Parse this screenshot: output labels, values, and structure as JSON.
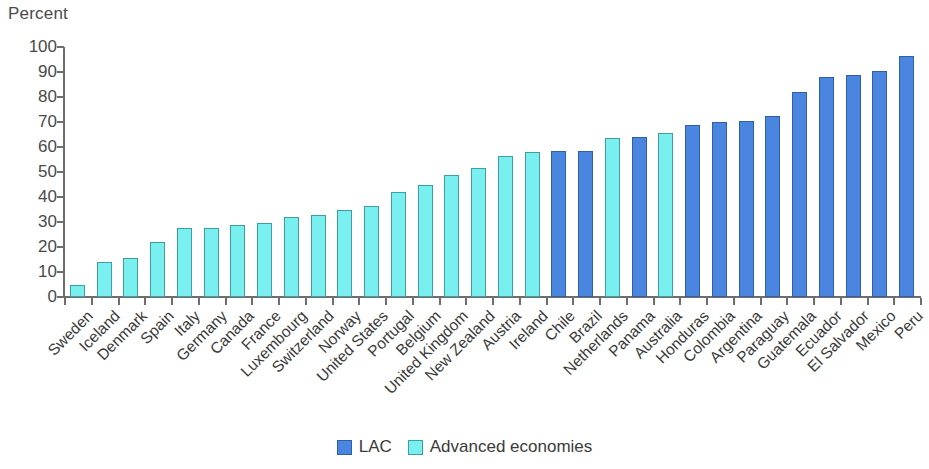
{
  "chart_data": {
    "type": "bar",
    "title": "",
    "subtitle": "",
    "xlabel": "",
    "ylabel": "Percent",
    "ylim": [
      0,
      100
    ],
    "ytick_step": 10,
    "yticks": [
      0,
      10,
      20,
      30,
      40,
      50,
      60,
      70,
      80,
      90,
      100
    ],
    "grid": false,
    "legend_position": "bottom-center",
    "categories": [
      "Sweden",
      "Iceland",
      "Denmark",
      "Spain",
      "Italy",
      "Germany",
      "Canada",
      "France",
      "Luxembourg",
      "Switzerland",
      "Norway",
      "United States",
      "Portugal",
      "Belgium",
      "United Kingdom",
      "New Zealand",
      "Austria",
      "Ireland",
      "Chile",
      "Brazil",
      "Netherlands",
      "Panama",
      "Australia",
      "Honduras",
      "Colombia",
      "Argentina",
      "Paraguay",
      "Guatemala",
      "Ecuador",
      "El Salvador",
      "Mexico",
      "Peru"
    ],
    "values": [
      5,
      14,
      15.5,
      22,
      27.5,
      27.5,
      29,
      29.5,
      32,
      33,
      35,
      36.5,
      42,
      45,
      49,
      51.5,
      56.5,
      58,
      58.5,
      58.5,
      63.5,
      64,
      65.5,
      69,
      70,
      70.5,
      72.5,
      82,
      88,
      89,
      90.5,
      96.5
    ],
    "groups": [
      "adv",
      "adv",
      "adv",
      "adv",
      "adv",
      "adv",
      "adv",
      "adv",
      "adv",
      "adv",
      "adv",
      "adv",
      "adv",
      "adv",
      "adv",
      "adv",
      "adv",
      "adv",
      "lac",
      "lac",
      "adv",
      "lac",
      "adv",
      "lac",
      "lac",
      "lac",
      "lac",
      "lac",
      "lac",
      "lac",
      "lac",
      "lac"
    ],
    "series": [
      {
        "name": "LAC",
        "key": "lac",
        "color": "#4a86e0",
        "points": [
          {
            "category": "Chile",
            "value": 58.5
          },
          {
            "category": "Brazil",
            "value": 58.5
          },
          {
            "category": "Panama",
            "value": 64
          },
          {
            "category": "Honduras",
            "value": 69
          },
          {
            "category": "Colombia",
            "value": 70
          },
          {
            "category": "Argentina",
            "value": 70.5
          },
          {
            "category": "Paraguay",
            "value": 72.5
          },
          {
            "category": "Guatemala",
            "value": 82
          },
          {
            "category": "Ecuador",
            "value": 88
          },
          {
            "category": "El Salvador",
            "value": 89
          },
          {
            "category": "Mexico",
            "value": 90.5
          },
          {
            "category": "Peru",
            "value": 96.5
          }
        ]
      },
      {
        "name": "Advanced economies",
        "key": "adv",
        "color": "#79efef",
        "points": [
          {
            "category": "Sweden",
            "value": 5
          },
          {
            "category": "Iceland",
            "value": 14
          },
          {
            "category": "Denmark",
            "value": 15.5
          },
          {
            "category": "Spain",
            "value": 22
          },
          {
            "category": "Italy",
            "value": 27.5
          },
          {
            "category": "Germany",
            "value": 27.5
          },
          {
            "category": "Canada",
            "value": 29
          },
          {
            "category": "France",
            "value": 29.5
          },
          {
            "category": "Luxembourg",
            "value": 32
          },
          {
            "category": "Switzerland",
            "value": 33
          },
          {
            "category": "Norway",
            "value": 35
          },
          {
            "category": "United States",
            "value": 36.5
          },
          {
            "category": "Portugal",
            "value": 42
          },
          {
            "category": "Belgium",
            "value": 45
          },
          {
            "category": "United Kingdom",
            "value": 49
          },
          {
            "category": "New Zealand",
            "value": 51.5
          },
          {
            "category": "Austria",
            "value": 56.5
          },
          {
            "category": "Ireland",
            "value": 58
          },
          {
            "category": "Netherlands",
            "value": 63.5
          },
          {
            "category": "Australia",
            "value": 65.5
          }
        ]
      }
    ]
  },
  "legend": {
    "items": [
      {
        "label": "LAC",
        "key": "lac",
        "color": "#4a86e0"
      },
      {
        "label": "Advanced economies",
        "key": "adv",
        "color": "#79efef"
      }
    ]
  },
  "colors": {
    "lac": "#4a86e0",
    "advanced": "#79efef",
    "axis": "#6e6e6e",
    "text": "#3a3a3a",
    "background": "#ffffff"
  }
}
